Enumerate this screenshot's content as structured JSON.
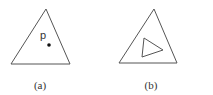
{
  "figures": [
    {
      "id": "a",
      "caption": "(a)",
      "outer_triangle": [
        [
          46,
          9
        ],
        [
          11,
          64
        ],
        [
          70,
          64
        ]
      ],
      "point": {
        "label": "p",
        "x": 49,
        "y": 45,
        "label_x": 40,
        "label_y": 39
      },
      "caption_pos": {
        "x": 40,
        "y": 89
      }
    },
    {
      "id": "b",
      "caption": "(b)",
      "outer_triangle": [
        [
          154,
          9
        ],
        [
          119,
          63
        ],
        [
          177,
          63
        ]
      ],
      "inner_triangle": [
        [
          144,
          38
        ],
        [
          142,
          57
        ],
        [
          163,
          50
        ]
      ],
      "caption_pos": {
        "x": 151,
        "y": 89
      }
    }
  ],
  "colors": {
    "stroke": "#555555",
    "text": "#333333",
    "point": "#111111",
    "background": "#ffffff"
  }
}
